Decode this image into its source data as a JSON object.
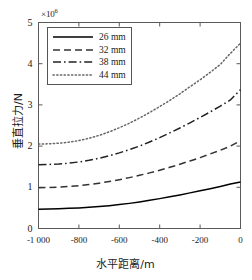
{
  "chart_data": {
    "type": "line",
    "title": "",
    "xlabel": "水平距离/m",
    "ylabel": "垂直拉力/N",
    "y_exponent_label": "×10",
    "y_exponent_power": "6",
    "xlim": [
      -1000,
      0
    ],
    "ylim": [
      0,
      5
    ],
    "xticks": [
      -1000,
      -800,
      -600,
      -400,
      -200,
      0
    ],
    "xticklabels": [
      "-1 000",
      "-800",
      "-600",
      "-400",
      "-200",
      "0"
    ],
    "yticks": [
      0,
      1,
      2,
      3,
      4,
      5
    ],
    "yticklabels": [
      "0",
      "1",
      "2",
      "3",
      "4",
      "5"
    ],
    "grid": false,
    "legend_position": "upper left",
    "x": [
      -1000,
      -950,
      -900,
      -850,
      -800,
      -750,
      -700,
      -650,
      -600,
      -550,
      -500,
      -450,
      -400,
      -350,
      -300,
      -250,
      -200,
      -150,
      -100,
      -50,
      0
    ],
    "series": [
      {
        "name": "26 mm",
        "label": "26 mm",
        "linestyle": "solid",
        "color": "#000000",
        "values": [
          0.47,
          0.475,
          0.48,
          0.49,
          0.5,
          0.515,
          0.535,
          0.555,
          0.58,
          0.61,
          0.645,
          0.685,
          0.725,
          0.77,
          0.815,
          0.865,
          0.915,
          0.965,
          1.02,
          1.08,
          1.13
        ]
      },
      {
        "name": "32 mm",
        "label": "32 mm",
        "linestyle": "dashed",
        "color": "#333333",
        "values": [
          0.99,
          0.995,
          1.005,
          1.02,
          1.04,
          1.065,
          1.1,
          1.14,
          1.185,
          1.235,
          1.29,
          1.35,
          1.415,
          1.485,
          1.56,
          1.64,
          1.72,
          1.81,
          1.9,
          2.0,
          2.13
        ]
      },
      {
        "name": "38 mm",
        "label": "38 mm",
        "linestyle": "dashdot",
        "color": "#222222",
        "values": [
          1.55,
          1.555,
          1.565,
          1.585,
          1.615,
          1.655,
          1.705,
          1.765,
          1.835,
          1.915,
          2.0,
          2.1,
          2.205,
          2.32,
          2.44,
          2.565,
          2.695,
          2.83,
          2.97,
          3.12,
          3.37
        ]
      },
      {
        "name": "44 mm",
        "label": "44 mm",
        "linestyle": "dotted",
        "color": "#666666",
        "values": [
          2.05,
          2.055,
          2.07,
          2.095,
          2.135,
          2.19,
          2.26,
          2.345,
          2.445,
          2.555,
          2.68,
          2.815,
          2.96,
          3.11,
          3.27,
          3.44,
          3.61,
          3.79,
          3.98,
          4.25,
          4.5
        ]
      }
    ]
  },
  "legend": {
    "items": [
      {
        "label": "26 mm",
        "style": "solid"
      },
      {
        "label": "32 mm",
        "style": "dashed"
      },
      {
        "label": "38 mm",
        "style": "dashdot"
      },
      {
        "label": "44 mm",
        "style": "dotted"
      }
    ]
  }
}
